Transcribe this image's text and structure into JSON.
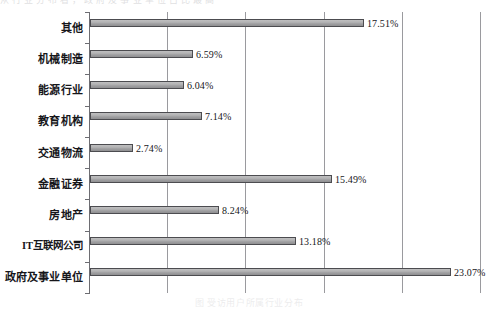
{
  "page": {
    "top_clipped_text": "从 行 业 分 布 看 ， 政 府 及 事 业 单 位 占 比 最 高",
    "bottom_clipped_caption": "图 受访用户所属行业分布"
  },
  "chart_data": {
    "type": "bar",
    "orientation": "horizontal",
    "title": "",
    "xlabel": "",
    "ylabel": "",
    "xlim": [
      0,
      26.8
    ],
    "grid": true,
    "gridlines": [
      5,
      10,
      15,
      20,
      25
    ],
    "legend": "none",
    "categories": [
      "其他",
      "机械制造",
      "能源行业",
      "教育机构",
      "交通物流",
      "金融证券",
      "房地产",
      "IT互联网公司",
      "政府及事业单位"
    ],
    "values": [
      17.51,
      6.59,
      6.04,
      7.14,
      2.74,
      15.49,
      8.24,
      13.18,
      23.07
    ],
    "value_labels": [
      "17.51%",
      "6.59%",
      "6.04%",
      "7.14%",
      "2.74%",
      "15.49%",
      "8.24%",
      "13.18%",
      "23.07%"
    ],
    "bar_fill_color": "#aeaeb0",
    "bar_border_color": "#4c4c50",
    "axis_color": "#6d6d72",
    "grid_color": "#9a9a9e",
    "label_color": "#16161a"
  }
}
